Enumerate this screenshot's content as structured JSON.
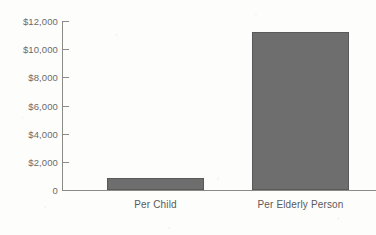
{
  "chart_data": {
    "type": "bar",
    "title": "",
    "subtitle": "",
    "xlabel": "",
    "ylabel": "",
    "categories": [
      "Per Child",
      "Per Elderly Person"
    ],
    "values": [
      850,
      11200
    ],
    "value_unit": "US dollars",
    "ylim": [
      0,
      12000
    ],
    "ytick_values": [
      0,
      2000,
      4000,
      6000,
      8000,
      10000,
      12000
    ],
    "ytick_labels": [
      "0",
      "$2,000",
      "$4,000",
      "$6,000",
      "$8,000",
      "$10,000",
      "$12,000"
    ],
    "grid": false,
    "legend": null,
    "legend_position": "none",
    "series": [
      {
        "name": "Government spending per person",
        "values": [
          850,
          11200
        ]
      }
    ],
    "annotations": [],
    "colors": {
      "bar_fill": "#6e6e6e",
      "bar_border": "#59595a",
      "axis": "#8a8a87",
      "tick_label": "#6b6b68",
      "category_label": "#59595a",
      "background": "#fdfdfc"
    }
  },
  "axis": {
    "y_ticks": [
      {
        "label": "$12,000",
        "value": 12000
      },
      {
        "label": "$10,000",
        "value": 10000
      },
      {
        "label": "$8,000",
        "value": 8000
      },
      {
        "label": "$6,000",
        "value": 6000
      },
      {
        "label": "$4,000",
        "value": 4000
      },
      {
        "label": "$2,000",
        "value": 2000
      },
      {
        "label": "0",
        "value": 0
      }
    ]
  },
  "bars": [
    {
      "label": "Per Child",
      "value": 850
    },
    {
      "label": "Per Elderly Person",
      "value": 11200
    }
  ]
}
